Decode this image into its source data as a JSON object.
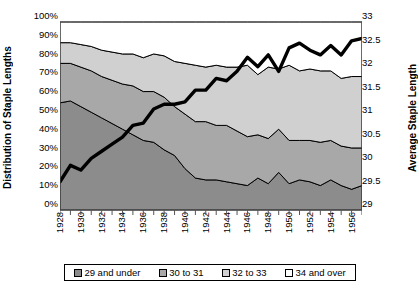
{
  "chart_data": {
    "type": "area",
    "title": "",
    "xlabel": "",
    "ylabel": "Distribution of Staple Lengths",
    "y2label": "Average Staple Length",
    "stacked": true,
    "grid": false,
    "legend_position": "bottom",
    "ylim": [
      0,
      100
    ],
    "y2lim": [
      29,
      33
    ],
    "xlim": [
      1928,
      1957
    ],
    "ytick_labels": [
      "100%",
      "90%",
      "80%",
      "70%",
      "60%",
      "50%",
      "40%",
      "30%",
      "20%",
      "10%",
      "0%"
    ],
    "ytick_values": [
      100,
      90,
      80,
      70,
      60,
      50,
      40,
      30,
      20,
      10,
      0
    ],
    "y2tick_labels": [
      "33",
      "32.5",
      "32",
      "31.5",
      "31",
      "30.5",
      "30",
      "29.5",
      "29"
    ],
    "y2tick_values": [
      33,
      32.5,
      32,
      31.5,
      31,
      30.5,
      30,
      29.5,
      29
    ],
    "x": [
      1928,
      1929,
      1930,
      1931,
      1932,
      1933,
      1934,
      1935,
      1936,
      1937,
      1938,
      1939,
      1940,
      1941,
      1942,
      1943,
      1944,
      1945,
      1946,
      1947,
      1948,
      1949,
      1950,
      1951,
      1952,
      1953,
      1954,
      1955,
      1956,
      1957
    ],
    "xtick_labels": [
      "1928",
      "1930",
      "1932",
      "1934",
      "1936",
      "1938",
      "1940",
      "1942",
      "1944",
      "1946",
      "1948",
      "1950",
      "1952",
      "1954",
      "1956"
    ],
    "xtick_values": [
      1928,
      1930,
      1932,
      1934,
      1936,
      1938,
      1940,
      1942,
      1944,
      1946,
      1948,
      1950,
      1952,
      1954,
      1956
    ],
    "series": [
      {
        "name": "29 and under",
        "color": "#8c8c8c",
        "values": [
          57,
          58,
          55,
          52,
          49,
          46,
          43,
          40,
          37,
          36,
          32,
          29,
          22,
          17,
          16,
          16,
          15,
          14,
          13,
          17,
          14,
          20,
          14,
          16,
          15,
          13,
          16,
          13,
          11,
          13
        ]
      },
      {
        "name": "30 to 31",
        "color": "#a8a8a8",
        "values": [
          21,
          20,
          21,
          22,
          22,
          23,
          24,
          26,
          26,
          27,
          28,
          26,
          29,
          30,
          31,
          29,
          30,
          28,
          26,
          23,
          24,
          23,
          23,
          21,
          22,
          23,
          21,
          21,
          22,
          20
        ]
      },
      {
        "name": "32 to 33",
        "color": "#d0d0d0",
        "values": [
          11,
          11,
          12,
          13,
          14,
          15,
          16,
          17,
          18,
          20,
          22,
          24,
          27,
          30,
          29,
          32,
          31,
          34,
          38,
          32,
          38,
          32,
          40,
          37,
          38,
          38,
          37,
          36,
          38,
          38
        ]
      },
      {
        "name": "34 and over",
        "color": "#ffffff",
        "values": [
          11,
          11,
          12,
          13,
          15,
          16,
          17,
          17,
          19,
          17,
          18,
          21,
          22,
          23,
          24,
          23,
          24,
          24,
          23,
          28,
          24,
          25,
          23,
          26,
          25,
          26,
          26,
          30,
          29,
          29
        ]
      }
    ],
    "line_series": {
      "name": "Average Staple Length",
      "color": "#000000",
      "axis": "secondary",
      "values": [
        29.6,
        29.95,
        29.85,
        30.1,
        30.25,
        30.4,
        30.55,
        30.8,
        30.85,
        31.15,
        31.25,
        31.25,
        31.3,
        31.55,
        31.55,
        31.8,
        31.75,
        31.95,
        32.25,
        32.05,
        32.3,
        31.95,
        32.45,
        32.55,
        32.4,
        32.3,
        32.5,
        32.3,
        32.6,
        32.65
      ]
    }
  },
  "axes": {
    "left_title": "Distribution of Staple Lengths",
    "right_title": "Average Staple Length"
  },
  "legend": {
    "items": [
      {
        "label": "29 and under",
        "color": "#8c8c8c"
      },
      {
        "label": "30 to 31",
        "color": "#a8a8a8"
      },
      {
        "label": "32 to 33",
        "color": "#d0d0d0"
      },
      {
        "label": "34 and over",
        "color": "#ffffff"
      }
    ]
  }
}
